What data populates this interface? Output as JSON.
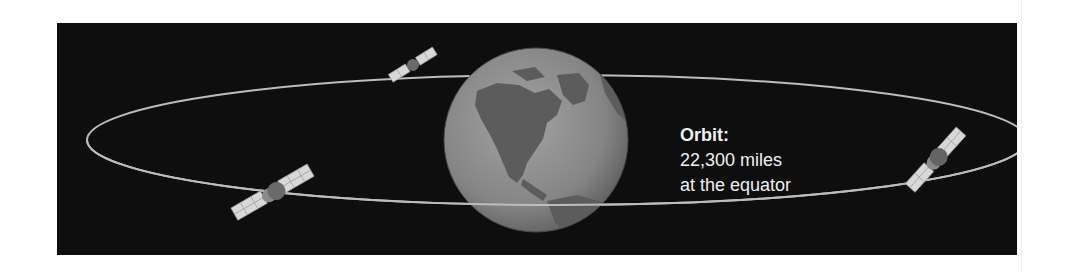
{
  "diagram": {
    "caption": {
      "title": "Orbit:",
      "line1": "22,300 miles",
      "line2": "at the equator"
    },
    "elements": {
      "earth": "globe showing North America",
      "orbit": "elliptical orbit line around the equator",
      "satellites": 3
    },
    "colors": {
      "background": "#0e0e0e",
      "orbit_line": "#bdbdbd",
      "globe": "#8a8a8a",
      "land": "#5a5a5a",
      "text": "#f0f0f0"
    }
  }
}
